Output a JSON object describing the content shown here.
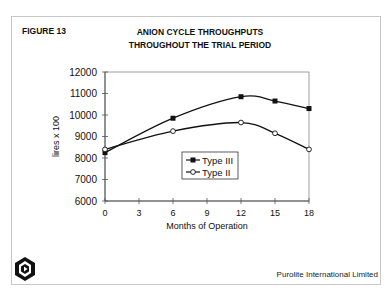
{
  "figure": {
    "label": "FIGURE 13",
    "title_line1": "ANION CYCLE THROUGHPUTS",
    "title_line2": "THROUGHOUT THE TRIAL PERIOD",
    "footer": "Purolite International Limited",
    "logo_icon": "purolite-hexagon-logo"
  },
  "chart_data": {
    "type": "line",
    "title": "ANION CYCLE THROUGHPUTS THROUGHOUT THE TRIAL PERIOD",
    "xlabel": "Months of Operation",
    "ylabel": "lires x 100",
    "x": [
      0,
      6,
      12,
      15,
      18
    ],
    "xticks": [
      0,
      3,
      6,
      9,
      12,
      15,
      18
    ],
    "yticks": [
      6000,
      7000,
      8000,
      9000,
      10000,
      11000,
      12000
    ],
    "xlim": [
      0,
      18
    ],
    "ylim": [
      6000,
      12000
    ],
    "grid": false,
    "legend_position": "inside-lower-center",
    "series": [
      {
        "name": "Type III",
        "marker": "filled-square",
        "values": [
          8250,
          9850,
          10850,
          10650,
          10300
        ]
      },
      {
        "name": "Type II",
        "marker": "open-circle",
        "values": [
          8400,
          9250,
          9650,
          9150,
          8400
        ]
      }
    ]
  }
}
